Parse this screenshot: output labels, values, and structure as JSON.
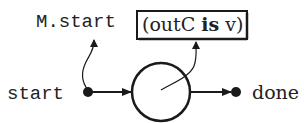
{
  "diagram": {
    "type": "state-machine-fragment",
    "labels": {
      "start": "start",
      "done": "done",
      "state_ref": "M.start"
    },
    "condition_box": {
      "open_paren": "(",
      "var": "outC",
      "keyword": "is",
      "value": "v",
      "close_paren": ")"
    },
    "nodes": [
      {
        "id": "start",
        "kind": "filled-dot"
      },
      {
        "id": "state",
        "kind": "circle"
      },
      {
        "id": "done",
        "kind": "filled-dot"
      }
    ],
    "edges": [
      {
        "from": "start",
        "to": "state",
        "kind": "arrow"
      },
      {
        "from": "state",
        "to": "done",
        "kind": "arrow"
      },
      {
        "from": "start",
        "to": "M.start",
        "kind": "annotation-arrow"
      },
      {
        "from": "state",
        "to": "condition_box",
        "kind": "annotation-arrow"
      }
    ],
    "colors": {
      "ink": "#1a1a1a",
      "background": "#ffffff"
    }
  }
}
